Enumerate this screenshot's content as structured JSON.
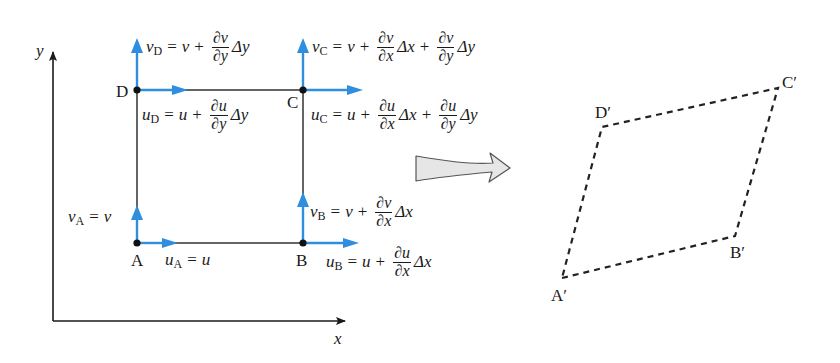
{
  "axes": {
    "x_label": "x",
    "y_label": "y"
  },
  "points": {
    "A": "A",
    "B": "B",
    "C": "C",
    "D": "D"
  },
  "deformed_points": {
    "A": "A′",
    "B": "B′",
    "C": "C′",
    "D": "D′"
  },
  "colors": {
    "velocity_arrow": "#2f8fde",
    "element_edge": "#333333",
    "axis": "#1a1a1a",
    "deformed_edge": "#222222",
    "transform_arrow_fill": "#e6e6e6"
  },
  "equations": {
    "vA": {
      "lhs": "v",
      "sub": "A",
      "rhs": "v"
    },
    "uA": {
      "lhs": "u",
      "sub": "A",
      "rhs": "u"
    },
    "vB": {
      "lhs": "v",
      "sub": "B",
      "base": "v",
      "t1_num": "∂v",
      "t1_den": "∂x",
      "t1_d": "Δx"
    },
    "uB": {
      "lhs": "u",
      "sub": "B",
      "base": "u",
      "t1_num": "∂u",
      "t1_den": "∂x",
      "t1_d": "Δx"
    },
    "vC": {
      "lhs": "v",
      "sub": "C",
      "base": "v",
      "t1_num": "∂v",
      "t1_den": "∂x",
      "t1_d": "Δx",
      "t2_num": "∂v",
      "t2_den": "∂y",
      "t2_d": "Δy"
    },
    "uC": {
      "lhs": "u",
      "sub": "C",
      "base": "u",
      "t1_num": "∂u",
      "t1_den": "∂x",
      "t1_d": "Δx",
      "t2_num": "∂u",
      "t2_den": "∂y",
      "t2_d": "Δy"
    },
    "vD": {
      "lhs": "v",
      "sub": "D",
      "base": "v",
      "t1_num": "∂v",
      "t1_den": "∂y",
      "t1_d": "Δy"
    },
    "uD": {
      "lhs": "u",
      "sub": "D",
      "base": "u",
      "t1_num": "∂u",
      "t1_den": "∂y",
      "t1_d": "Δy"
    }
  },
  "symbols": {
    "eq": "=",
    "plus": "+"
  }
}
